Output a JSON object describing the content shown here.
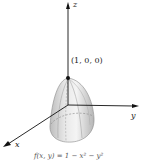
{
  "figure": {
    "axes": {
      "x_label": "x",
      "y_label": "y",
      "z_label": "z"
    },
    "point_label": "(1, 0, 0)",
    "caption": "f(x, y) = 1 − x² − y²",
    "colors": {
      "surface_light": "#f2f2f2",
      "surface_dark": "#b8b8b8",
      "axis": "#111111"
    }
  }
}
